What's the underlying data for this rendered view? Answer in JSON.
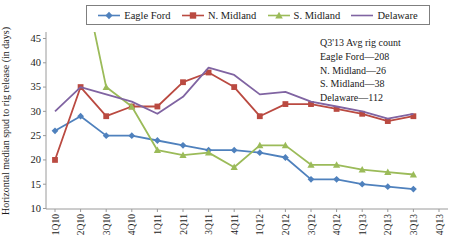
{
  "chart_data": {
    "type": "line",
    "title": "",
    "xlabel": "",
    "ylabel": "Horizontal median spud to rig release (in days)",
    "ylim": [
      10,
      45
    ],
    "ytick_step": 5,
    "grid": false,
    "legend_position": "top",
    "categories": [
      "1Q10",
      "2Q10",
      "3Q10",
      "4Q10",
      "1Q11",
      "2Q11",
      "3Q11",
      "4Q11",
      "1Q12",
      "2Q12",
      "3Q12",
      "4Q12",
      "1Q13",
      "2Q13",
      "3Q13",
      "4Q13"
    ],
    "series": [
      {
        "name": "Eagle Ford",
        "color": "#4F81BD",
        "marker": "diamond",
        "values": [
          26,
          29,
          25,
          25,
          24,
          23,
          22,
          22,
          21.5,
          20.5,
          16,
          16,
          15,
          14.5,
          14,
          null
        ]
      },
      {
        "name": "N. Midland",
        "color": "#BA4A41",
        "marker": "square",
        "values": [
          20,
          35,
          29,
          31,
          31,
          36,
          38,
          35,
          29,
          31.5,
          31.5,
          30.5,
          29.5,
          28,
          29,
          null
        ]
      },
      {
        "name": "S. Midland",
        "color": "#9BBB59",
        "marker": "triangle",
        "values": [
          null,
          60,
          35,
          31,
          22,
          21,
          21.5,
          18.5,
          23,
          23,
          19,
          19,
          18,
          17.5,
          17,
          null
        ]
      },
      {
        "name": "Delaware",
        "color": "#8064A2",
        "marker": "none",
        "values": [
          30,
          35,
          33.5,
          32,
          29.5,
          33,
          39,
          37.5,
          33.5,
          34,
          32,
          31,
          30,
          28.5,
          29.5,
          null
        ]
      }
    ],
    "annotation": {
      "lines": [
        "Q3'13 Avg rig count",
        "Eagle Ford—208",
        "N. Midland—26",
        "S. Midland—38",
        "Delaware—112"
      ]
    }
  }
}
